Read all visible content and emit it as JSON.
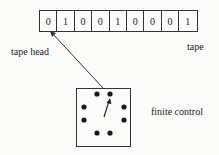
{
  "diagram": {
    "tape": {
      "cells": [
        "0",
        "1",
        "0",
        "0",
        "1",
        "0",
        "0",
        "0",
        "1"
      ],
      "label": "tape"
    },
    "tape_head": {
      "label": "tape head",
      "position_index": 0
    },
    "finite_control": {
      "label": "finite control",
      "state_dots": 8
    },
    "colors": {
      "line": "#333333",
      "background": "#fbfbf9",
      "text": "#222222"
    }
  }
}
